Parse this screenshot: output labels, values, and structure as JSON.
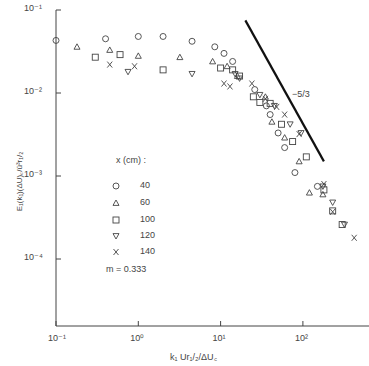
{
  "chart_data": {
    "type": "scatter",
    "title": "",
    "xlabel": "k₁ Ur₁/₂/ΔU꜀",
    "ylabel": "E₁(k₁)(ΔU)꜀/ū³r₁/₂",
    "xscale": "log",
    "yscale": "log",
    "xlim": [
      0.1,
      450
    ],
    "ylim": [
      1.5e-05,
      0.1
    ],
    "x_ticks": [
      "10⁻¹",
      "10⁰",
      "10¹",
      "10²"
    ],
    "y_ticks": [
      "10⁻¹",
      "10⁻²",
      "10⁻³",
      "10⁻⁴"
    ],
    "legend_title": "x (cm) :",
    "legend_note": "m = 0.333",
    "slope_label": "−5/3",
    "slope_line": {
      "x": [
        20,
        180
      ],
      "y": [
        0.075,
        0.0015
      ]
    },
    "series": [
      {
        "name": "40",
        "marker": "circle",
        "points": [
          [
            0.1,
            0.043
          ],
          [
            0.4,
            0.045
          ],
          [
            1.0,
            0.048
          ],
          [
            2.0,
            0.048
          ],
          [
            4.5,
            0.042
          ],
          [
            8.5,
            0.036
          ],
          [
            11,
            0.03
          ],
          [
            14,
            0.024
          ],
          [
            26,
            0.011
          ],
          [
            36,
            0.007
          ],
          [
            40,
            0.0055
          ],
          [
            50,
            0.0033
          ],
          [
            60,
            0.0022
          ],
          [
            80,
            0.0011
          ],
          [
            150,
            0.00075
          ]
        ]
      },
      {
        "name": "60",
        "marker": "triangle-up",
        "points": [
          [
            0.18,
            0.036
          ],
          [
            0.45,
            0.033
          ],
          [
            1.0,
            0.028
          ],
          [
            3.2,
            0.027
          ],
          [
            8,
            0.024
          ],
          [
            12,
            0.021
          ],
          [
            16,
            0.016
          ],
          [
            35,
            0.009
          ],
          [
            42,
            0.0045
          ],
          [
            60,
            0.0029
          ],
          [
            90,
            0.0015
          ],
          [
            120,
            0.00063
          ],
          [
            175,
            0.0006
          ]
        ]
      },
      {
        "name": "100",
        "marker": "square",
        "points": [
          [
            0.3,
            0.027
          ],
          [
            0.6,
            0.029
          ],
          [
            2.0,
            0.019
          ],
          [
            10,
            0.02
          ],
          [
            14,
            0.019
          ],
          [
            17,
            0.016
          ],
          [
            25,
            0.009
          ],
          [
            30,
            0.0077
          ],
          [
            40,
            0.0075
          ],
          [
            55,
            0.0042
          ],
          [
            75,
            0.0026
          ],
          [
            110,
            0.0017
          ],
          [
            180,
            0.00068
          ],
          [
            230,
            0.00038
          ],
          [
            300,
            0.00026
          ]
        ]
      },
      {
        "name": "120",
        "marker": "triangle-down",
        "points": [
          [
            0.75,
            0.018
          ],
          [
            4.5,
            0.017
          ],
          [
            15,
            0.017
          ],
          [
            17,
            0.015
          ],
          [
            30,
            0.0095
          ],
          [
            45,
            0.007
          ],
          [
            70,
            0.0042
          ],
          [
            95,
            0.0033
          ],
          [
            175,
            0.00075
          ],
          [
            230,
            0.00048
          ],
          [
            320,
            0.00026
          ]
        ]
      },
      {
        "name": "140",
        "marker": "x",
        "points": [
          [
            0.45,
            0.022
          ],
          [
            0.9,
            0.021
          ],
          [
            11,
            0.013
          ],
          [
            13,
            0.012
          ],
          [
            24,
            0.013
          ],
          [
            35,
            0.0085
          ],
          [
            48,
            0.0068
          ],
          [
            60,
            0.0055
          ],
          [
            90,
            0.0032
          ],
          [
            180,
            0.0008
          ],
          [
            230,
            0.00037
          ],
          [
            420,
            0.00018
          ]
        ]
      }
    ]
  },
  "legend": {
    "title": "x (cm) :",
    "items": [
      {
        "marker": "circle",
        "label": "40"
      },
      {
        "marker": "triangle-up",
        "label": "60"
      },
      {
        "marker": "square",
        "label": "100"
      },
      {
        "marker": "triangle-down",
        "label": "120"
      },
      {
        "marker": "x",
        "label": "140"
      }
    ],
    "note": "m = 0.333"
  },
  "axes": {
    "xlabel": "k₁ Ur₁/₂/ΔU꜀",
    "ylabel": "E₁(k₁)(ΔU)꜀/ū³r₁/₂",
    "slope": "−5/3"
  }
}
